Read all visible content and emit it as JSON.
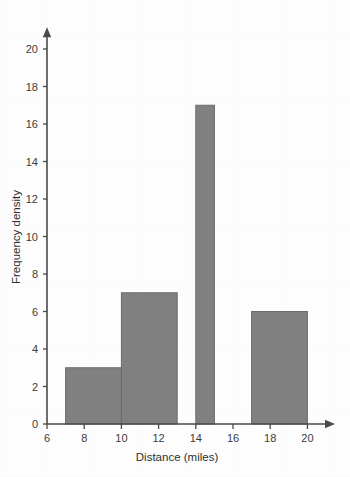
{
  "chart_data": {
    "type": "bar",
    "title": "",
    "subtitle": "",
    "xlabel": "Distance (miles)",
    "ylabel": "Frequency density",
    "xlim": [
      6,
      21
    ],
    "ylim": [
      0,
      21
    ],
    "xticks": [
      6,
      8,
      10,
      12,
      14,
      16,
      18,
      20
    ],
    "yticks": [
      0,
      2,
      4,
      6,
      8,
      10,
      12,
      14,
      16,
      18,
      20
    ],
    "xtick_labels": [
      "6",
      "8",
      "10",
      "12",
      "14",
      "16",
      "18",
      "20"
    ],
    "ytick_labels": [
      "0",
      "2",
      "4",
      "6",
      "8",
      "10",
      "12",
      "14",
      "16",
      "18",
      "20"
    ],
    "grid": false,
    "legend": null,
    "bar_color": "#808080",
    "bar_edge_color": "#6b6b6b",
    "axis_color": "#4a4a4a",
    "background_color": "#ffffff",
    "bars": [
      {
        "label": "7-10",
        "x_start": 7,
        "x_end": 10,
        "value": 3
      },
      {
        "label": "10-13",
        "x_start": 10,
        "x_end": 13,
        "value": 7
      },
      {
        "label": "14-15",
        "x_start": 14,
        "x_end": 15,
        "value": 17
      },
      {
        "label": "17-20",
        "x_start": 17,
        "x_end": 20,
        "value": 6
      }
    ],
    "categories": [
      "7-10",
      "10-13",
      "14-15",
      "17-20"
    ],
    "values": [
      3,
      7,
      17,
      6
    ]
  }
}
